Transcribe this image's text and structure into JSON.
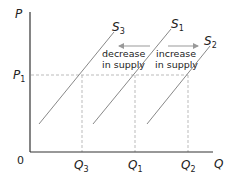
{
  "diagram": {
    "type": "supply-shift",
    "axes": {
      "y_label": "P",
      "x_label": "Q",
      "origin_label": "0"
    },
    "price_levels": [
      {
        "label": "P",
        "sub": "1"
      }
    ],
    "quantity_levels": [
      {
        "label": "Q",
        "sub": "3"
      },
      {
        "label": "Q",
        "sub": "1"
      },
      {
        "label": "Q",
        "sub": "2"
      }
    ],
    "curves": [
      {
        "label": "S",
        "sub": "3"
      },
      {
        "label": "S",
        "sub": "1"
      },
      {
        "label": "S",
        "sub": "2"
      }
    ],
    "annotations": {
      "decrease_line1": "decrease",
      "decrease_line2": "in supply",
      "increase_line1": "increase",
      "increase_line2": "in supply"
    },
    "colors": {
      "axis": "#333333",
      "curve": "#888888",
      "dashed": "#aaaaaa",
      "arrow": "#999999"
    }
  }
}
